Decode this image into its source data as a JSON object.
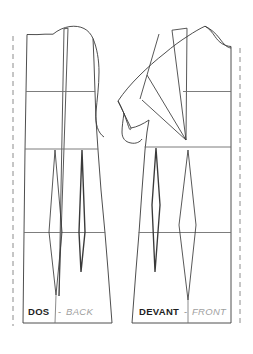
{
  "document": {
    "title": "Bodice Block Pattern Draft",
    "type": "sewing-pattern-technical-drawing",
    "width": 253,
    "height": 354,
    "background_color": "#ffffff"
  },
  "style": {
    "outline_color": "#3a3a3a",
    "construction_color": "#6e6e6e",
    "fold_line_color": "#8c8c8c",
    "dart_color": "#3a3a3a",
    "label_dark": "#1d1d1d",
    "label_grey": "#a0a0a0",
    "separator_grey": "#8a8a8a",
    "line_width": "0.9"
  },
  "pieces": [
    {
      "id": "back",
      "label_primary": "DOS",
      "label_separator": "-",
      "label_secondary": "BACK",
      "label_x": 28,
      "label_y": 315,
      "separator_x": 58,
      "secondary_x": 65,
      "fold_edge": "left",
      "outline": "M 27,33 L 27,323 L 110,323 L 104,232 L 98,148 L 95,91 L 93,37 L 86,29.5 L 77,26 L 68,26.5 L 60,29 L 53,33 L 44,34 L 34,33.5 Z",
      "notes": "Back bodice with shoulder dart, chest/bust/waist construction lines and two waist darts"
    },
    {
      "id": "front",
      "label_primary": "DEVANT",
      "label_separator": "-",
      "label_secondary": "FRONT",
      "label_x": 140,
      "label_y": 315,
      "separator_x": 184,
      "secondary_x": 192,
      "fold_edge": "right",
      "outline": "M 228,50 L 228,323 L 133,323 L 128,232 L 124,148 L 121,123 L 119,100 L 150,42 L 160,35 L 172,30 L 186,26 L 199,24 L 204,28 L 208,36 L 214,45 L 222,49 Z",
      "notes": "Front bodice with shoulder dart, bust (side) dart, construction lines and two waist darts"
    }
  ],
  "construction_lines": [
    {
      "name": "chest-line-back",
      "x1": 27,
      "y1": 91,
      "x2": 95,
      "y2": 91
    },
    {
      "name": "bust-line-back",
      "x1": 27,
      "y1": 148,
      "x2": 98,
      "y2": 148
    },
    {
      "name": "waist-line-back",
      "x1": 27,
      "y1": 232,
      "x2": 104,
      "y2": 232
    },
    {
      "name": "chest-line-front",
      "x1": 157,
      "y1": 91,
      "x2": 228,
      "y2": 91
    },
    {
      "name": "bust-line-front",
      "x1": 124,
      "y1": 148,
      "x2": 228,
      "y2": 148
    },
    {
      "name": "waist-line-front",
      "x1": 128,
      "y1": 232,
      "x2": 228,
      "y2": 232
    }
  ],
  "fold_lines": [
    {
      "name": "center-back-fold-line",
      "x": 13,
      "y1": 36,
      "x2": 13,
      "y2": 325,
      "dash": "5,4"
    },
    {
      "name": "center-front-fold-line",
      "x": 240,
      "y1": 48,
      "x2": 240,
      "y2": 325,
      "dash": "5,4"
    }
  ],
  "darts": {
    "back": [
      {
        "name": "back-shoulder-dart",
        "apex_y": 295,
        "type": "shoulder"
      },
      {
        "name": "back-waist-dart-inner",
        "type": "waist"
      },
      {
        "name": "back-waist-dart-outer",
        "type": "waist"
      }
    ],
    "front": [
      {
        "name": "front-shoulder-dart",
        "type": "shoulder"
      },
      {
        "name": "front-bust-dart",
        "type": "bust-side"
      },
      {
        "name": "front-waist-dart-inner",
        "type": "waist"
      },
      {
        "name": "front-waist-dart-outer",
        "type": "waist"
      }
    ]
  }
}
